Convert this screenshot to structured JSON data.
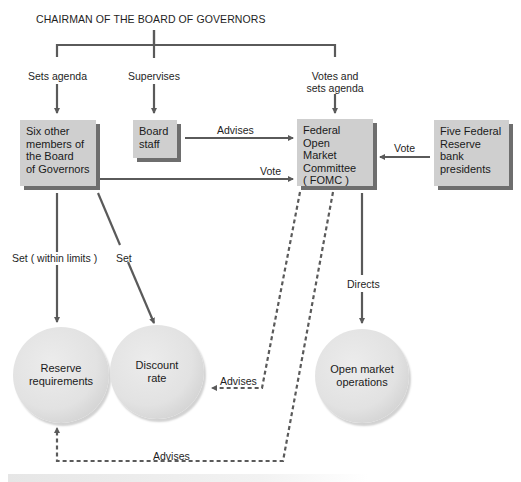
{
  "title": "CHAIRMAN OF THE BOARD OF GOVERNORS",
  "nodes": {
    "six_members": {
      "lines": [
        "Six other",
        "members of",
        "the Board",
        "of Governors"
      ]
    },
    "board_staff": {
      "lines": [
        "Board",
        "staff"
      ]
    },
    "fomc": {
      "lines": [
        "Federal Open",
        "Market",
        "Committee",
        "( FOMC )"
      ]
    },
    "five_presidents": {
      "lines": [
        "Five Federal",
        "Reserve bank",
        "presidents"
      ]
    },
    "reserve_requirements": {
      "lines": [
        "Reserve",
        "requirements"
      ]
    },
    "discount_rate": {
      "lines": [
        "Discount",
        "rate"
      ]
    },
    "open_market_operations": {
      "lines": [
        "Open market",
        "operations"
      ]
    }
  },
  "edges": {
    "sets_agenda": "Sets agenda",
    "supervises": "Supervises",
    "votes_and_sets_agenda": [
      "Votes and",
      "sets agenda"
    ],
    "advises_staff_fomc": "Advises",
    "vote_board_fomc": "Vote",
    "vote_presidents_fomc": "Vote",
    "set_within_limits": "Set ( within limits )",
    "set_discount": "Set",
    "directs": "Directs",
    "advises_fomc_discount": "Advises",
    "advises_fomc_reserve": "Advises"
  },
  "colors": {
    "line": "#5a5a5a",
    "box_fill": "#cfcfcf",
    "box_shadow": "#6e6e6e",
    "circle_fill": "#e2e2e2",
    "text": "#1a1a1a"
  }
}
